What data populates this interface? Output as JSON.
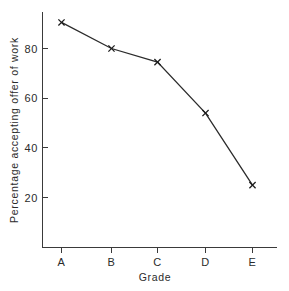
{
  "chart_data": {
    "type": "line",
    "title": "",
    "xlabel": "Grade",
    "ylabel": "Percentage accepting offer of work",
    "categories": [
      "A",
      "B",
      "C",
      "D",
      "E"
    ],
    "values": [
      90.5,
      80.0,
      74.5,
      54.0,
      25.0
    ],
    "series": [
      {
        "name": "Percentage accepting offer of work",
        "values": [
          90.5,
          80.0,
          74.5,
          54.0,
          25.0
        ]
      }
    ],
    "marker": "x",
    "ylim": [
      0,
      95
    ],
    "xlim": [
      0,
      5.5
    ],
    "yticks": [
      20,
      40,
      60,
      80
    ],
    "ytick_labels": [
      "20",
      "40",
      "60",
      "80"
    ],
    "xtick_labels": [
      "A",
      "B",
      "C",
      "D",
      "E"
    ],
    "grid": false,
    "legend": false,
    "legend_position": "none",
    "line_color": "#2b2b2b",
    "axis_color": "#3a3a3a",
    "background_color": "#ffffff"
  }
}
